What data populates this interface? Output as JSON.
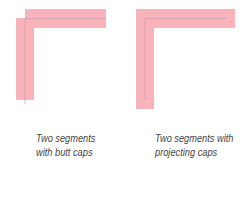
{
  "colors": {
    "stroke_fill": "#f9b3bb",
    "centerline": "#c49aa6",
    "caption_text": "#444444"
  },
  "figures": [
    {
      "id": "butt",
      "caption_lines": [
        "Two segments",
        "with butt caps"
      ]
    },
    {
      "id": "projecting",
      "caption_lines": [
        "Two segments with",
        "projecting caps"
      ]
    }
  ]
}
